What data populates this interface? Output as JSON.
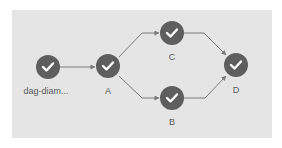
{
  "diagram": {
    "type": "dag",
    "colors": {
      "background": "#e5e5e5",
      "node_fill": "#5e5e5e",
      "check": "#ffffff",
      "edge": "#7a7a7a",
      "label": "#5a5a5a"
    },
    "nodes": [
      {
        "id": "root",
        "label": "dag-diam...",
        "status": "success",
        "icon": "check-icon",
        "x": 48,
        "y": 67
      },
      {
        "id": "A",
        "label": "A",
        "status": "success",
        "icon": "check-icon",
        "x": 108,
        "y": 66
      },
      {
        "id": "C",
        "label": "C",
        "status": "success",
        "icon": "check-icon",
        "x": 172,
        "y": 33
      },
      {
        "id": "B",
        "label": "B",
        "status": "success",
        "icon": "check-icon",
        "x": 172,
        "y": 98
      },
      {
        "id": "D",
        "label": "D",
        "status": "success",
        "icon": "check-icon",
        "x": 236,
        "y": 65
      }
    ],
    "edges": [
      {
        "from": "root",
        "to": "A"
      },
      {
        "from": "A",
        "to": "C"
      },
      {
        "from": "A",
        "to": "B"
      },
      {
        "from": "C",
        "to": "D"
      },
      {
        "from": "B",
        "to": "D"
      }
    ]
  }
}
